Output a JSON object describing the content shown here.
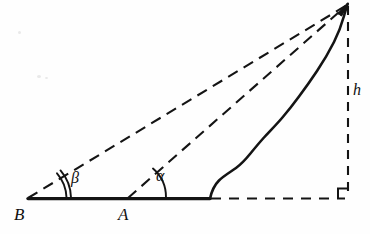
{
  "figure": {
    "type": "geometry-diagram",
    "background_color": "#fefefe",
    "ink_color": "#141414",
    "labels": {
      "vertex_b": "B",
      "vertex_a": "A",
      "angle_beta": "β",
      "angle_alpha": "α",
      "height": "h"
    },
    "points": {
      "b": {
        "x": 28,
        "y": 199
      },
      "a": {
        "x": 128,
        "y": 199
      },
      "hill_base": {
        "x": 210,
        "y": 199
      },
      "summit": {
        "x": 348,
        "y": 4
      },
      "foot": {
        "x": 348,
        "y": 199
      }
    },
    "label_positions": {
      "vertex_b": {
        "x": 14,
        "y": 206
      },
      "vertex_a": {
        "x": 118,
        "y": 206
      },
      "angle_beta": {
        "x": 71,
        "y": 170
      },
      "angle_alpha": {
        "x": 156,
        "y": 168
      },
      "height": {
        "x": 353,
        "y": 82
      }
    },
    "elements": {
      "baseline_solid": "solid baseline from B through A to hill base",
      "baseline_dashed": "dashed baseline from hill base to foot of height",
      "sightline_beta": "dashed line from B to summit",
      "sightline_alpha": "dashed line from A to summit",
      "hill_profile": "solid irregular curve from hill base to summit",
      "height_line": "dashed vertical line from summit to foot",
      "right_angle_marker": "small square at foot of height",
      "arc_beta": "double arc marking angle at B",
      "arc_alpha": "single arc marking angle at A"
    }
  }
}
